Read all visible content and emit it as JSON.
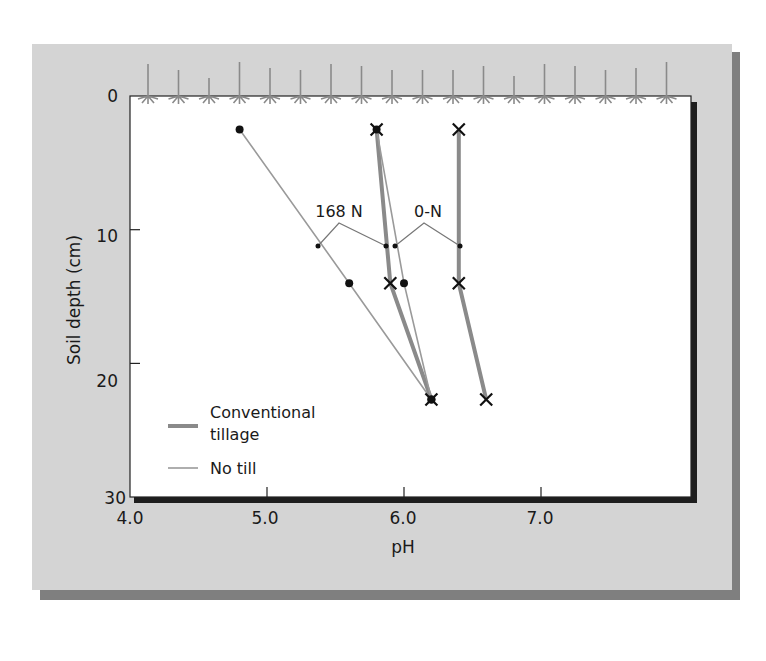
{
  "chart_data": {
    "type": "line",
    "title": "",
    "xlabel": "pH",
    "ylabel": "Soil depth (cm)",
    "xlim": [
      4.0,
      8.0
    ],
    "ylim": [
      30,
      0
    ],
    "y_inverted": true,
    "x_ticks": [
      "4.0",
      "5.0",
      "6.0",
      "7.0"
    ],
    "y_ticks": [
      "0",
      "10",
      "20",
      "30"
    ],
    "grid": false,
    "legend_position": "lower-left inside plot",
    "legend": [
      {
        "label_line1": "Conventional",
        "label_line2": "tillage",
        "style": "thick"
      },
      {
        "label_line1": "No till",
        "label_line2": "",
        "style": "thin"
      }
    ],
    "annotations": [
      {
        "text": "168 N",
        "points_to": [
          "no-till-168N",
          "conventional-168N"
        ]
      },
      {
        "text": "0-N",
        "points_to": [
          "no-till-0N",
          "conventional-0N"
        ]
      }
    ],
    "series": [
      {
        "name": "No till, 168 N",
        "tillage": "No till",
        "nitrogen": "168 N",
        "marker": "dot",
        "points": [
          {
            "pH": 4.8,
            "depth": 2.5
          },
          {
            "pH": 5.6,
            "depth": 14
          },
          {
            "pH": 6.2,
            "depth": 22.7
          }
        ]
      },
      {
        "name": "Conventional tillage, 168 N",
        "tillage": "Conventional tillage",
        "nitrogen": "168 N",
        "marker": "x",
        "points": [
          {
            "pH": 5.8,
            "depth": 2.5
          },
          {
            "pH": 5.9,
            "depth": 14
          },
          {
            "pH": 6.2,
            "depth": 22.7
          }
        ]
      },
      {
        "name": "No till, 0-N",
        "tillage": "No till",
        "nitrogen": "0-N",
        "marker": "dot",
        "points": [
          {
            "pH": 5.8,
            "depth": 2.5
          },
          {
            "pH": 6.0,
            "depth": 14
          },
          {
            "pH": 6.2,
            "depth": 22.7
          }
        ]
      },
      {
        "name": "Conventional tillage, 0-N",
        "tillage": "Conventional tillage",
        "nitrogen": "0-N",
        "marker": "x",
        "points": [
          {
            "pH": 6.4,
            "depth": 2.5
          },
          {
            "pH": 6.4,
            "depth": 14
          },
          {
            "pH": 6.6,
            "depth": 22.7
          }
        ]
      }
    ],
    "decoration": "row of seedling plants drawn along the soil surface (depth 0)"
  },
  "colors": {
    "panel": "#d4d4d4",
    "panel_shadow": "#7f7f7f",
    "plot_bg": "#ffffff",
    "conventional_line": "#8a8a8a",
    "no_till_line": "#9a9a9a",
    "marker": "#111111"
  }
}
